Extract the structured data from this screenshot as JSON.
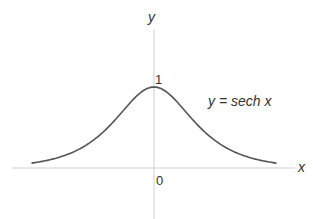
{
  "chart_data": {
    "type": "line",
    "title": "",
    "xlabel": "x",
    "ylabel": "y",
    "annotation": "y = sech x",
    "tick_labels": {
      "origin": "0",
      "y_one": "1"
    },
    "xlim": [
      -3.5,
      3.5
    ],
    "ylim": [
      0,
      1
    ],
    "grid": false,
    "series": [
      {
        "name": "y = sech x",
        "x": [
          -3.5,
          -3,
          -2.5,
          -2,
          -1.5,
          -1,
          -0.5,
          0,
          0.5,
          1,
          1.5,
          2,
          2.5,
          3,
          3.5
        ],
        "values": [
          0.06,
          0.099,
          0.163,
          0.266,
          0.425,
          0.648,
          0.887,
          1.0,
          0.887,
          0.648,
          0.425,
          0.266,
          0.163,
          0.099,
          0.06
        ]
      }
    ],
    "colors": {
      "curve": "#555555",
      "axes": "#cccccc",
      "text": "#333333"
    }
  }
}
